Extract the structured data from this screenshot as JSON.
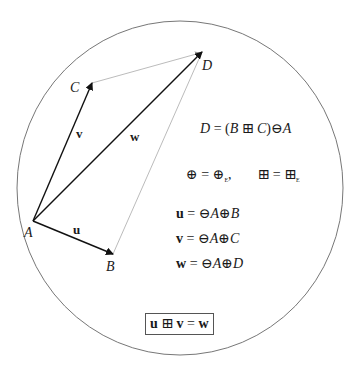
{
  "diagram": {
    "type": "gyroparallelogram-in-disk",
    "disk": {
      "cx": 180,
      "cy": 188,
      "rx": 163,
      "ry": 167,
      "stroke": "#777777"
    },
    "points": {
      "A": {
        "x": 33,
        "y": 221,
        "label": "A"
      },
      "B": {
        "x": 113,
        "y": 254,
        "label": "B"
      },
      "C": {
        "x": 92,
        "y": 83,
        "label": "C"
      },
      "D": {
        "x": 202,
        "y": 52,
        "label": "D"
      }
    },
    "vectors": [
      {
        "name": "u",
        "from": "A",
        "to": "B",
        "label": "u"
      },
      {
        "name": "v",
        "from": "A",
        "to": "C",
        "label": "v"
      },
      {
        "name": "w",
        "from": "A",
        "to": "D",
        "label": "w"
      }
    ],
    "thin_edges": [
      {
        "from": "C",
        "to": "D"
      },
      {
        "from": "B",
        "to": "D"
      }
    ]
  },
  "equations": {
    "d_def": {
      "lhs": "D",
      "eq": " = (",
      "b": "B",
      "op": " ⊞ ",
      "c": "C",
      "close": ")⊖",
      "a": "A"
    },
    "ops_line": {
      "oplus": "⊕",
      "eq1": " = ",
      "oplus_e": "⊕",
      "sub1": "E",
      "comma": ",",
      "boxplus": "⊞",
      "eq2": " = ",
      "boxplus_e": "⊞",
      "sub2": "E"
    },
    "u_def": {
      "vec": "u",
      "rhs_pre": " = ⊖",
      "a": "A",
      "op": "⊕",
      "pt": "B"
    },
    "v_def": {
      "vec": "v",
      "rhs_pre": " = ⊖",
      "a": "A",
      "op": "⊕",
      "pt": "C"
    },
    "w_def": {
      "vec": "w",
      "rhs_pre": " = ⊖",
      "a": "A",
      "op": "⊕",
      "pt": "D"
    },
    "boxed": {
      "u": "u",
      "op": " ⊞ ",
      "v": "v",
      "eq": " = ",
      "w": "w"
    }
  }
}
